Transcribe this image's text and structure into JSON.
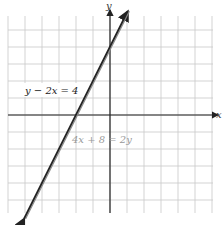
{
  "chart_data": {
    "type": "line",
    "title": "",
    "xlabel": "x",
    "ylabel": "y",
    "xlim": [
      -6,
      6
    ],
    "ylim": [
      -6,
      6
    ],
    "grid": true,
    "series": [
      {
        "name": "y - 2x = 4",
        "equation": "y = 2x + 4",
        "x": [
          -5,
          -4,
          -3,
          -2,
          -1,
          0,
          1
        ],
        "values": [
          -6,
          -4,
          -2,
          0,
          2,
          4,
          6
        ],
        "color": "#222222"
      },
      {
        "name": "4x + 8 = 2y",
        "equation": "y = 2x + 4",
        "x": [
          -5,
          -4,
          -3,
          -2,
          -1,
          0,
          1
        ],
        "values": [
          -6,
          -4,
          -2,
          0,
          2,
          4,
          6
        ],
        "color": "#888888"
      }
    ],
    "annotations": [
      "y - 2x = 4",
      "4x + 8 = 2y"
    ],
    "note": "Both equations describe the same (coincident) line"
  },
  "labels": {
    "x_axis": "x",
    "y_axis": "y",
    "eq1": "y − 2x = 4",
    "eq2": "4x + 8 = 2y"
  }
}
